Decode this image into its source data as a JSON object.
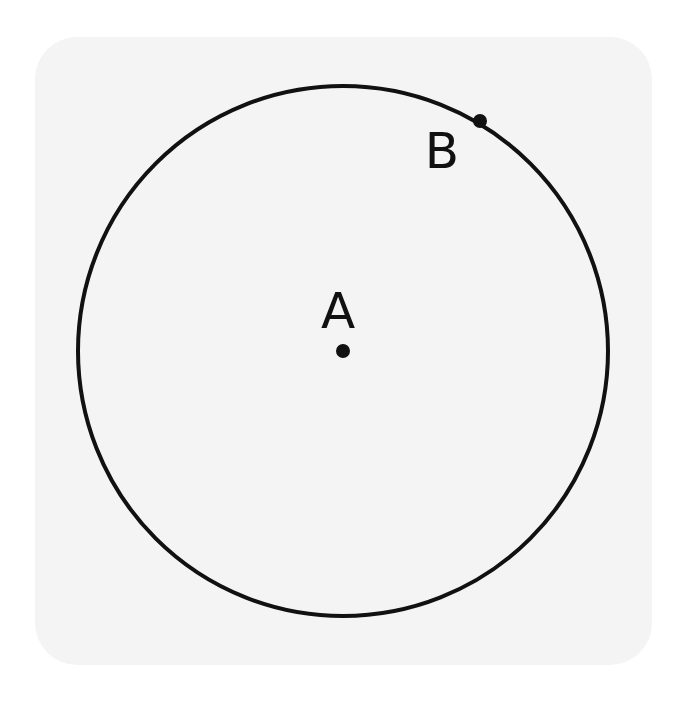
{
  "figure": {
    "type": "circle-with-points",
    "background_color": "#f4f4f4",
    "stroke_color": "#111111",
    "circle": {
      "center_label": "A",
      "cx": 343,
      "cy": 351,
      "r": 265,
      "stroke_width": 4
    },
    "points": [
      {
        "label": "A",
        "x": 343,
        "y": 351,
        "role": "center",
        "label_x": 338,
        "label_y": 328
      },
      {
        "label": "B",
        "x": 480,
        "y": 121,
        "role": "on-circle",
        "label_x": 442,
        "label_y": 168
      }
    ]
  },
  "labels": {
    "point_a": "A",
    "point_b": "B"
  }
}
